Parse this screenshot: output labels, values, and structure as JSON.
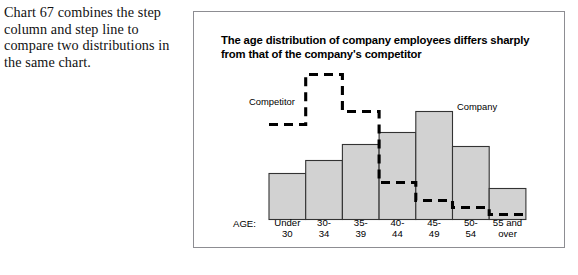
{
  "caption": {
    "text": "Chart 67 combines the step column and step line to compare two distributions in the same chart."
  },
  "panel": {
    "title": "The age distribution of company employees differs sharply from that of the company's competitor",
    "axis_caption": "AGE:",
    "series_labels": {
      "competitor": "Competitor",
      "company": "Company"
    }
  },
  "chart_data": {
    "type": "bar",
    "title": "The age distribution of company employees differs sharply from that of the company's competitor",
    "xlabel": "AGE:",
    "ylabel": "",
    "grid": false,
    "legend_position": "inline-annotation",
    "categories": [
      "Under 30",
      "30-34",
      "35-39",
      "40-44",
      "45-49",
      "50-54",
      "55 and over"
    ],
    "category_lines": [
      [
        "Under",
        "30"
      ],
      [
        "30-",
        "34"
      ],
      [
        "35-",
        "39"
      ],
      [
        "40-",
        "44"
      ],
      [
        "45-",
        "49"
      ],
      [
        "50-",
        "54"
      ],
      [
        "55 and",
        "over"
      ]
    ],
    "ylim": [
      0,
      150
    ],
    "series": [
      {
        "name": "Company",
        "render": "step-column",
        "color": "#d2d2d2",
        "values": [
          46,
          59,
          75,
          87,
          108,
          73,
          31
        ]
      },
      {
        "name": "Competitor",
        "render": "step-line",
        "color": "#000000",
        "style": "dashed",
        "values": [
          95,
          145,
          108,
          37,
          19,
          12,
          5
        ]
      }
    ]
  }
}
